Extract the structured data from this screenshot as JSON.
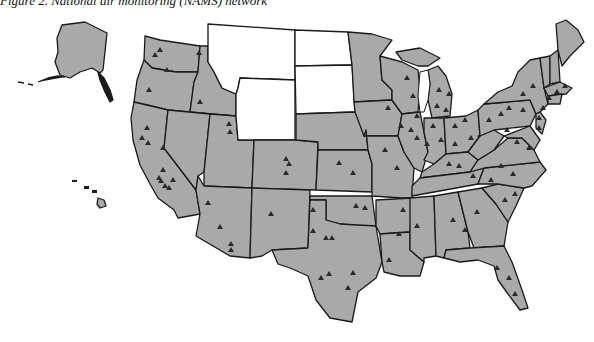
{
  "figure": {
    "title": "Figure 2. National air monitoring (NAMS) network"
  },
  "map": {
    "subject": "United States NAMS monitoring stations",
    "legend": null,
    "colors": {
      "states_with_stations": "#a9a9a9",
      "states_without_stations": "#ffffff",
      "borders": "#1a1a1a",
      "station_marker": "#2a2a2a"
    },
    "marker_shape": "triangle",
    "states_without_stations": [
      "Montana",
      "Wyoming",
      "North Dakota",
      "South Dakota"
    ],
    "insets": [
      "Alaska",
      "Hawaii"
    ]
  }
}
